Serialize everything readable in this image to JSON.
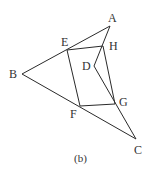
{
  "diagram": {
    "caption": "(b)",
    "points": {
      "A": {
        "label": "A",
        "x": 110,
        "y": 26
      },
      "B": {
        "label": "B",
        "x": 22,
        "y": 74
      },
      "C": {
        "label": "C",
        "x": 136,
        "y": 139
      },
      "D": {
        "label": "D",
        "x": 94,
        "y": 66
      },
      "E": {
        "label": "E",
        "x": 67,
        "y": 50
      },
      "F": {
        "label": "F",
        "x": 80,
        "y": 106
      },
      "G": {
        "label": "G",
        "x": 115,
        "y": 104
      },
      "H": {
        "label": "H",
        "x": 103,
        "y": 46
      }
    },
    "segments": [
      [
        "A",
        "B"
      ],
      [
        "B",
        "C"
      ],
      [
        "A",
        "D"
      ],
      [
        "D",
        "C"
      ],
      [
        "E",
        "H"
      ],
      [
        "H",
        "G"
      ],
      [
        "G",
        "F"
      ],
      [
        "F",
        "E"
      ]
    ]
  }
}
